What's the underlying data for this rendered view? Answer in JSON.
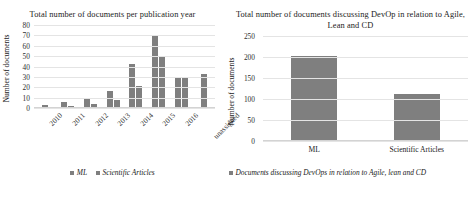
{
  "figure": {
    "background": "#ffffff",
    "bar_color": "#7f7f7f",
    "grid_color": "#e4e4e4",
    "axis_color": "#d3d3d3"
  },
  "left_panel": {
    "title": "Total number of documents per publication year",
    "ylabel": "Number of documents",
    "legend": [
      {
        "label": "ML"
      },
      {
        "label": "Scientific Articles"
      }
    ]
  },
  "right_panel": {
    "title": "Total number of documents discussing DevOp in relation to Agile, Lean and CD",
    "ylabel": "Number of documents",
    "legend": [
      {
        "label": "Documents discussing DevOps in relation to Agile, lean and CD"
      }
    ]
  },
  "chart_data": [
    {
      "type": "bar",
      "title": "Total number of documents per publication year",
      "xlabel": "",
      "ylabel": "Number of documents",
      "categories": [
        "2010",
        "2011",
        "2012",
        "2013",
        "2014",
        "2015",
        "2016",
        "unassigned"
      ],
      "series": [
        {
          "name": "ML",
          "values": [
            2,
            5,
            9,
            15,
            41,
            68,
            28,
            32
          ]
        },
        {
          "name": "Scientific Articles",
          "values": [
            0,
            1,
            3,
            7,
            20,
            48,
            28,
            0
          ]
        }
      ],
      "ylim": [
        0,
        80
      ],
      "yticks": [
        0,
        10,
        20,
        30,
        40,
        50,
        60,
        70,
        80
      ],
      "grid": true,
      "legend_position": "bottom",
      "xtick_rotation": -45
    },
    {
      "type": "bar",
      "title": "Total number of documents discussing DevOp in relation to Agile, Lean and CD",
      "xlabel": "",
      "ylabel": "Number of documents",
      "categories": [
        "ML",
        "Scientific Articles"
      ],
      "values": [
        200,
        110
      ],
      "series": [
        {
          "name": "Documents discussing DevOps in relation to Agile, lean and CD",
          "values": [
            200,
            110
          ]
        }
      ],
      "ylim": [
        0,
        250
      ],
      "yticks": [
        0,
        50,
        100,
        150,
        200,
        250
      ],
      "grid": true,
      "legend_position": "bottom",
      "xtick_rotation": 0
    }
  ]
}
